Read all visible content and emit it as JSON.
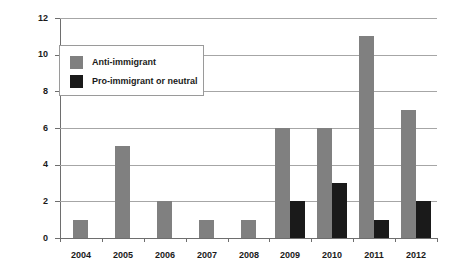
{
  "chart_data": {
    "type": "bar",
    "title": "",
    "subtitle": "",
    "xlabel": "",
    "ylabel": "",
    "categories": [
      "2004",
      "2005",
      "2006",
      "2007",
      "2008",
      "2009",
      "2010",
      "2011",
      "2012"
    ],
    "series": [
      {
        "name": "Anti-immigrant",
        "color": "#808080",
        "values": [
          1,
          5,
          2,
          1,
          1,
          6,
          6,
          11,
          7
        ]
      },
      {
        "name": "Pro-immigrant or neutral",
        "color": "#1a1a1a",
        "values": [
          0,
          0,
          0,
          0,
          0,
          2,
          3,
          1,
          2
        ]
      }
    ],
    "ylim": [
      0,
      12
    ],
    "yticks": [
      0,
      2,
      4,
      6,
      8,
      10,
      12
    ],
    "ytick_labels": [
      "0",
      "2",
      "4",
      "6",
      "8",
      "10",
      "12"
    ],
    "grid": "horizontal",
    "legend_position": "upper-left-inside"
  },
  "legend": {
    "items": [
      {
        "label": "Anti-immigrant"
      },
      {
        "label": "Pro-immigrant or neutral"
      }
    ]
  }
}
